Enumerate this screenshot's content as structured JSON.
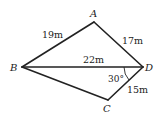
{
  "figure": {
    "type": "quadrilateral-with-diagonal",
    "points": {
      "A": {
        "label": "A"
      },
      "B": {
        "label": "B"
      },
      "C": {
        "label": "C"
      },
      "D": {
        "label": "D"
      }
    },
    "edges": {
      "AB": {
        "label": "19m"
      },
      "AD": {
        "label": "17m"
      },
      "BD": {
        "label": "22m"
      },
      "CD": {
        "label": "15m"
      },
      "BC": {
        "label": ""
      }
    },
    "angle": {
      "label": "30°",
      "at": "D",
      "between": "BD and CD"
    }
  }
}
